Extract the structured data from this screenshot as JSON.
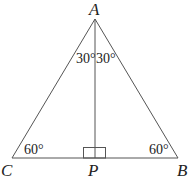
{
  "diagram": {
    "title": "",
    "points": {
      "A": {
        "label": "A",
        "x": 95,
        "y": 19
      },
      "B": {
        "label": "B",
        "x": 178,
        "y": 158
      },
      "C": {
        "label": "C",
        "x": 12,
        "y": 158
      },
      "P": {
        "label": "P",
        "x": 95,
        "y": 158
      }
    },
    "angles": {
      "A_left": "30°",
      "A_right": "30°",
      "C": "60°",
      "B": "60°"
    },
    "right_angle_at": "P",
    "line_color": "#555555"
  }
}
